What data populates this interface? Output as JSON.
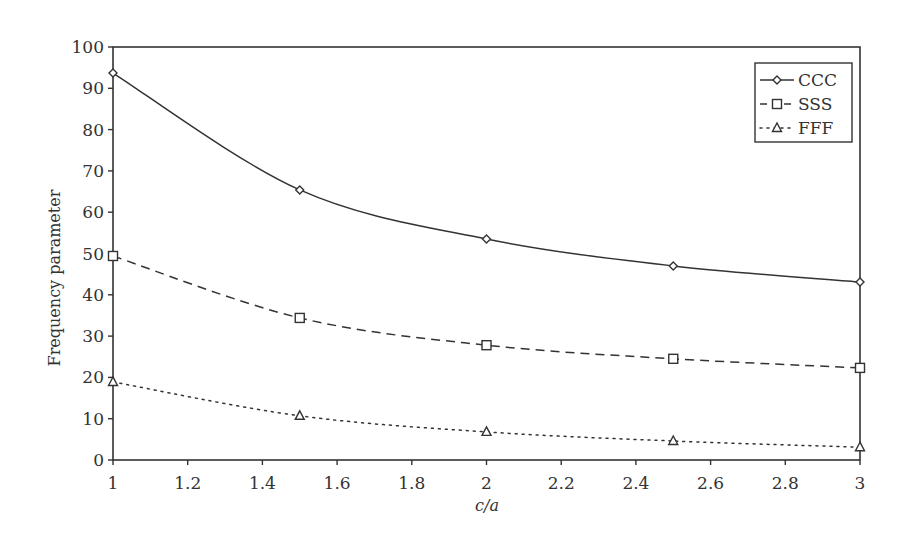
{
  "chart_data": {
    "type": "line",
    "title": "",
    "xlabel": "c/a",
    "ylabel": "Frequency parameter",
    "xlim": [
      1,
      3
    ],
    "ylim": [
      0,
      100
    ],
    "grid": false,
    "legend_position": "upper right",
    "x_ticks": [
      "1",
      "1.2",
      "1.4",
      "1.6",
      "1.8",
      "2",
      "2.2",
      "2.4",
      "2.6",
      "2.8",
      "3"
    ],
    "y_ticks": [
      "0",
      "10",
      "20",
      "30",
      "40",
      "50",
      "60",
      "70",
      "80",
      "90",
      "100"
    ],
    "x": [
      1,
      1.5,
      2,
      2.5,
      3
    ],
    "series": [
      {
        "name": "CCC",
        "values": [
          93.7,
          65.4,
          53.5,
          47.0,
          43.1
        ],
        "line": "solid",
        "marker": "diamond"
      },
      {
        "name": "SSS",
        "values": [
          49.4,
          34.4,
          27.8,
          24.5,
          22.3
        ],
        "line": "dashed",
        "marker": "square"
      },
      {
        "name": "FFF",
        "values": [
          18.9,
          10.7,
          6.8,
          4.6,
          3.1
        ],
        "line": "dotted",
        "marker": "triangle"
      }
    ]
  },
  "colors": {
    "line": "#333333",
    "background": "#ffffff"
  }
}
